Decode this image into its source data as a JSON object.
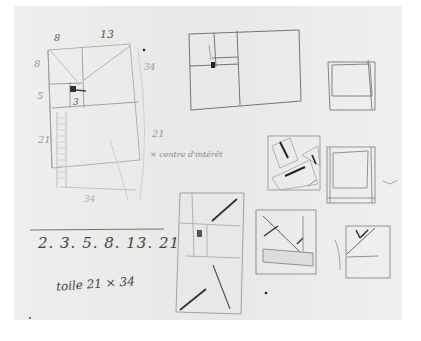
{
  "artwork": {
    "medium": "pencil sketch on paper",
    "annotations": {
      "top_label_8": "8",
      "top_label_13": "13",
      "left_label_8": "8",
      "left_label_5": "5",
      "inner_label_3": "3",
      "left_label_21": "21",
      "side_label_34": "34",
      "right_label_21": "21",
      "legend_note": "× centre d'intérêt",
      "bottom_label": "34",
      "sequence": "2. 3. 5. 8. 13. 21",
      "format": "toile 21 × 34"
    },
    "sketches": [
      "golden-spiral-grid",
      "large-rectangle-composition",
      "small-square-top-right",
      "tilted-planes-square",
      "nested-squares",
      "vertical-diagonal-composition",
      "triangle-composition",
      "small-triangle-square"
    ]
  }
}
